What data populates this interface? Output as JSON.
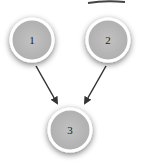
{
  "diagram": {
    "type": "directed-graph",
    "nodes": [
      {
        "id": "1",
        "label": "1",
        "cx": 32,
        "cy": 40,
        "r": 21
      },
      {
        "id": "2",
        "label": "2",
        "cx": 108,
        "cy": 40,
        "r": 21
      },
      {
        "id": "3",
        "label": "3",
        "cx": 70,
        "cy": 130,
        "r": 21
      }
    ],
    "edges": [
      {
        "from": "1",
        "to": "3"
      },
      {
        "from": "2",
        "to": "3"
      }
    ],
    "colors": {
      "node_fill": "#b9b9b9",
      "node_stroke": "#ffffff",
      "arrow": "#333333",
      "shadow": "#999999"
    }
  }
}
